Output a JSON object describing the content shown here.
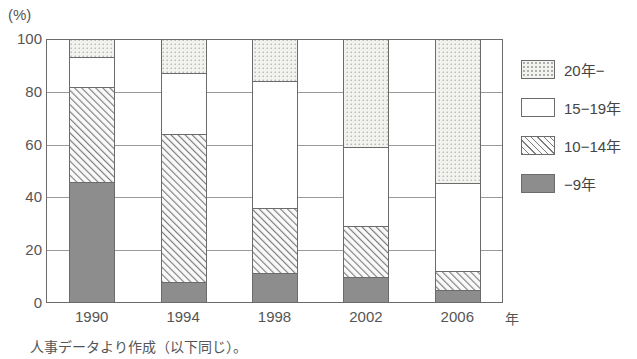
{
  "unit_label": "(%)",
  "axis": {
    "x_unit": "年",
    "x_categories": [
      "1990",
      "1994",
      "1998",
      "2002",
      "2006"
    ],
    "y_ticks": [
      "0",
      "20",
      "40",
      "60",
      "80",
      "100"
    ]
  },
  "legend": {
    "items": [
      {
        "label": "20年−",
        "pattern": "dots",
        "swatch_name": "legend-swatch-20plus"
      },
      {
        "label": "15−19年",
        "pattern": "white",
        "swatch_name": "legend-swatch-15-19"
      },
      {
        "label": "10−14年",
        "pattern": "hatch",
        "swatch_name": "legend-swatch-10-14"
      },
      {
        "label": "−9年",
        "pattern": "solid",
        "swatch_name": "legend-swatch-under9"
      }
    ]
  },
  "footnote": "人事データより作成（以下同じ）。",
  "colors": {
    "axis": "#6b6b6b",
    "gridline": "#9a9a9a",
    "bar_outline": "#6b6b6b",
    "solid_fill": "#8d8d8d",
    "dots_fill": "#f2f2ef",
    "hatch_fill": "#fafafa",
    "white_fill": "#ffffff",
    "text": "#555555"
  },
  "chart_data": {
    "type": "bar",
    "title": "",
    "subtitle": "",
    "xlabel": "年",
    "ylabel": "(%)",
    "ylim": [
      0,
      100
    ],
    "yticks": [
      0,
      20,
      40,
      60,
      80,
      100
    ],
    "grid": true,
    "stacked": true,
    "legend_position": "right",
    "categories": [
      "1990",
      "1994",
      "1998",
      "2002",
      "2006"
    ],
    "series": [
      {
        "name": "−9年",
        "pattern": "solid",
        "values": [
          46.0,
          8.0,
          11.5,
          10.0,
          5.0
        ]
      },
      {
        "name": "10−14年",
        "pattern": "hatch",
        "values": [
          36.0,
          56.0,
          24.5,
          19.0,
          7.0
        ]
      },
      {
        "name": "15−19年",
        "pattern": "white",
        "values": [
          11.0,
          23.0,
          48.0,
          30.0,
          33.5
        ]
      },
      {
        "name": "20年−",
        "pattern": "dots",
        "values": [
          7.0,
          13.0,
          16.0,
          41.0,
          54.5
        ]
      }
    ],
    "cumulative_tops": {
      "1990": {
        "under9": 46.0,
        "t10_14": 82.0,
        "t15_19": 93.0,
        "t20plus": 100.0
      },
      "1994": {
        "under9": 8.0,
        "t10_14": 64.0,
        "t15_19": 87.0,
        "t20plus": 100.0
      },
      "1998": {
        "under9": 11.5,
        "t10_14": 36.0,
        "t15_19": 84.0,
        "t20plus": 100.0
      },
      "2002": {
        "under9": 10.0,
        "t10_14": 29.0,
        "t15_19": 59.0,
        "t20plus": 100.0
      },
      "2006": {
        "under9": 5.0,
        "t10_14": 12.0,
        "t15_19": 45.5,
        "t20plus": 100.0
      }
    },
    "annotations": [
      "人事データより作成（以下同じ）。"
    ]
  }
}
